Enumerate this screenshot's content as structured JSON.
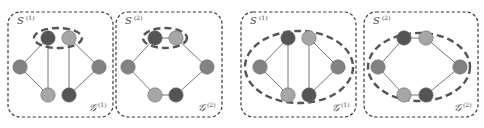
{
  "colors": {
    "dark": "#555555",
    "medium": "#828282",
    "light": "#a6a6a6",
    "box_stroke": "#3a3a3a",
    "ellipse_stroke": "#555555",
    "edge": "#666666"
  },
  "panels": [
    {
      "id": "p1",
      "s_label": "S",
      "s_sup": "(1)",
      "g_label": "𝒢",
      "g_sup": "(1)",
      "box": {
        "x": 8,
        "y": 12,
        "w": 105,
        "h": 105
      },
      "ellipse": {
        "cx": 58,
        "cy": 38,
        "rx": 24,
        "ry": 10
      },
      "nodes": [
        {
          "x": 48,
          "y": 38,
          "shade": "dark"
        },
        {
          "x": 69,
          "y": 38,
          "shade": "light"
        },
        {
          "x": 20,
          "y": 67,
          "shade": "medium"
        },
        {
          "x": 99,
          "y": 67,
          "shade": "medium"
        },
        {
          "x": 48,
          "y": 95,
          "shade": "light"
        },
        {
          "x": 69,
          "y": 95,
          "shade": "dark"
        }
      ],
      "edges": [
        [
          0,
          2
        ],
        [
          0,
          4
        ],
        [
          1,
          3
        ],
        [
          1,
          5
        ],
        [
          2,
          4
        ],
        [
          3,
          5
        ]
      ]
    },
    {
      "id": "p2",
      "s_label": "S",
      "s_sup": "(2)",
      "g_label": "𝒢",
      "g_sup": "(2)",
      "box": {
        "x": 116,
        "y": 12,
        "w": 106,
        "h": 105
      },
      "ellipse": {
        "cx": 165,
        "cy": 38,
        "rx": 22,
        "ry": 10
      },
      "nodes": [
        {
          "x": 155,
          "y": 38,
          "shade": "dark"
        },
        {
          "x": 176,
          "y": 38,
          "shade": "light"
        },
        {
          "x": 128,
          "y": 67,
          "shade": "medium"
        },
        {
          "x": 207,
          "y": 67,
          "shade": "medium"
        },
        {
          "x": 155,
          "y": 95,
          "shade": "light"
        },
        {
          "x": 176,
          "y": 95,
          "shade": "dark"
        }
      ],
      "edges": [
        [
          0,
          1
        ],
        [
          0,
          2
        ],
        [
          1,
          3
        ],
        [
          2,
          4
        ],
        [
          3,
          5
        ],
        [
          4,
          5
        ]
      ]
    },
    {
      "id": "p3",
      "s_label": "S",
      "s_sup": "(1)",
      "g_label": "𝒢",
      "g_sup": "(1)",
      "box": {
        "x": 241,
        "y": 12,
        "w": 115,
        "h": 105
      },
      "ellipse": {
        "cx": 299,
        "cy": 67,
        "rx": 54,
        "ry": 36
      },
      "nodes": [
        {
          "x": 288,
          "y": 38,
          "shade": "dark"
        },
        {
          "x": 309,
          "y": 38,
          "shade": "light"
        },
        {
          "x": 260,
          "y": 67,
          "shade": "medium"
        },
        {
          "x": 338,
          "y": 67,
          "shade": "medium"
        },
        {
          "x": 288,
          "y": 95,
          "shade": "light"
        },
        {
          "x": 309,
          "y": 95,
          "shade": "dark"
        }
      ],
      "edges": [
        [
          0,
          2
        ],
        [
          0,
          4
        ],
        [
          1,
          3
        ],
        [
          1,
          5
        ],
        [
          2,
          4
        ],
        [
          3,
          5
        ]
      ]
    },
    {
      "id": "p4",
      "s_label": "S",
      "s_sup": "(2)",
      "g_label": "𝒢",
      "g_sup": "(2)",
      "box": {
        "x": 364,
        "y": 12,
        "w": 114,
        "h": 105
      },
      "ellipse": {
        "cx": 419,
        "cy": 67,
        "rx": 51,
        "ry": 34
      },
      "nodes": [
        {
          "x": 404,
          "y": 38,
          "shade": "dark"
        },
        {
          "x": 426,
          "y": 38,
          "shade": "light"
        },
        {
          "x": 378,
          "y": 67,
          "shade": "medium"
        },
        {
          "x": 460,
          "y": 67,
          "shade": "medium"
        },
        {
          "x": 404,
          "y": 95,
          "shade": "light"
        },
        {
          "x": 426,
          "y": 95,
          "shade": "dark"
        }
      ],
      "edges": [
        [
          0,
          1
        ],
        [
          0,
          2
        ],
        [
          1,
          3
        ],
        [
          2,
          4
        ],
        [
          3,
          5
        ],
        [
          4,
          5
        ]
      ]
    }
  ]
}
